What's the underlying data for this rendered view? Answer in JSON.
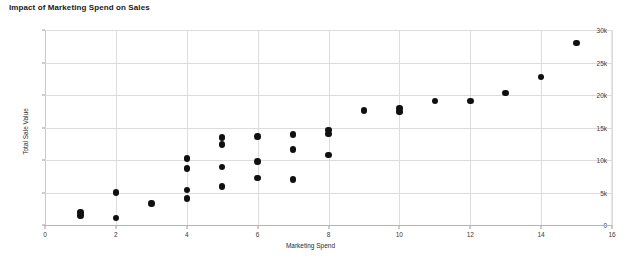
{
  "chart_data": {
    "type": "scatter",
    "title": "Impact of Marketing Spend on Sales",
    "xlabel": "Marketing Spend",
    "ylabel": "Total Sale Value",
    "xlim": [
      0,
      16
    ],
    "ylim": [
      0,
      30000
    ],
    "grid": true,
    "legend": "none",
    "marker_color": "#101010",
    "xticks": [
      {
        "value": 0,
        "label": "0"
      },
      {
        "value": 2,
        "label": "2"
      },
      {
        "value": 4,
        "label": "4"
      },
      {
        "value": 6,
        "label": "6"
      },
      {
        "value": 8,
        "label": "8"
      },
      {
        "value": 10,
        "label": "10"
      },
      {
        "value": 12,
        "label": "12"
      },
      {
        "value": 14,
        "label": "14"
      },
      {
        "value": 16,
        "label": "16"
      }
    ],
    "yticks": [
      {
        "value": 0,
        "label": "0"
      },
      {
        "value": 5000,
        "label": "5k"
      },
      {
        "value": 10000,
        "label": "10k"
      },
      {
        "value": 15000,
        "label": "15k"
      },
      {
        "value": 20000,
        "label": "20k"
      },
      {
        "value": 25000,
        "label": "25k"
      },
      {
        "value": 30000,
        "label": "30k"
      }
    ],
    "points": [
      {
        "x": 1,
        "y": 1900
      },
      {
        "x": 1,
        "y": 1500
      },
      {
        "x": 2,
        "y": 5000
      },
      {
        "x": 2,
        "y": 1100
      },
      {
        "x": 3,
        "y": 3300
      },
      {
        "x": 4,
        "y": 10200
      },
      {
        "x": 4,
        "y": 8700
      },
      {
        "x": 4,
        "y": 5400
      },
      {
        "x": 4,
        "y": 4100
      },
      {
        "x": 5,
        "y": 13500
      },
      {
        "x": 5,
        "y": 12400
      },
      {
        "x": 5,
        "y": 8900
      },
      {
        "x": 5,
        "y": 5900
      },
      {
        "x": 6,
        "y": 13600
      },
      {
        "x": 6,
        "y": 9800
      },
      {
        "x": 6,
        "y": 7200
      },
      {
        "x": 7,
        "y": 13900
      },
      {
        "x": 7,
        "y": 11600
      },
      {
        "x": 7,
        "y": 7000
      },
      {
        "x": 8,
        "y": 14600
      },
      {
        "x": 8,
        "y": 14000
      },
      {
        "x": 8,
        "y": 10800
      },
      {
        "x": 9,
        "y": 17600
      },
      {
        "x": 10,
        "y": 17900
      },
      {
        "x": 10,
        "y": 17400
      },
      {
        "x": 11,
        "y": 19100
      },
      {
        "x": 12,
        "y": 19100
      },
      {
        "x": 13,
        "y": 20300
      },
      {
        "x": 14,
        "y": 22800
      },
      {
        "x": 15,
        "y": 28000
      }
    ]
  }
}
